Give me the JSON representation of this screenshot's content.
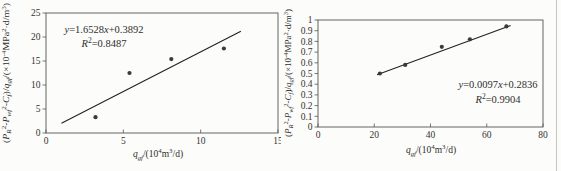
{
  "page": {
    "background": "#fcfcfa",
    "text_color": "#333333",
    "axis_color": "#555552",
    "line_color": "#222222",
    "marker_color": "#3a3a3a",
    "scan_edge_color": "#c4c4c0"
  },
  "chart_data": [
    {
      "type": "scatter",
      "title": "",
      "xlabel": "qgf/(10⁴m³/d)",
      "ylabel": "(PR²-Pwf²-Cf)/qgf/(×10⁻⁴MPa²·d/m³)",
      "equation": "y=1.6528x+0.3892",
      "r_squared": "R²=0.8487",
      "xlim": [
        0,
        15
      ],
      "ylim": [
        0,
        25
      ],
      "grid": false,
      "legend": "none",
      "xticks": [
        {
          "v": 0,
          "l": "0"
        },
        {
          "v": 5,
          "l": "5"
        },
        {
          "v": 10,
          "l": "10"
        },
        {
          "v": 15,
          "l": "15"
        }
      ],
      "yticks": [
        {
          "v": 0,
          "l": "0"
        },
        {
          "v": 5,
          "l": "5"
        },
        {
          "v": 10,
          "l": "10"
        },
        {
          "v": 15,
          "l": "15"
        },
        {
          "v": 20,
          "l": "20"
        },
        {
          "v": 25,
          "l": "25"
        }
      ],
      "points": [
        [
          3.2,
          3.3
        ],
        [
          5.4,
          12.5
        ],
        [
          8.1,
          15.4
        ],
        [
          11.5,
          17.6
        ]
      ],
      "trendline": {
        "slope": 1.6528,
        "intercept": 0.3892,
        "x_start": 1.0,
        "x_end": 12.6
      },
      "equation_parts": [
        {
          "t": "y",
          "s": "i"
        },
        {
          "t": "=1.6528",
          "s": "n"
        },
        {
          "t": "x",
          "s": "i"
        },
        {
          "t": "+0.3892",
          "s": "n"
        }
      ],
      "r2_parts": [
        {
          "t": "R",
          "s": "i"
        },
        {
          "t": "2",
          "s": "sup"
        },
        {
          "t": "=0.8487",
          "s": "n"
        }
      ],
      "xlabel_parts": [
        {
          "t": "q",
          "s": "i"
        },
        {
          "t": "gf",
          "s": "sub"
        },
        {
          "t": "/(10",
          "s": "n"
        },
        {
          "t": "4",
          "s": "sup"
        },
        {
          "t": "m",
          "s": "n"
        },
        {
          "t": "3",
          "s": "sup"
        },
        {
          "t": "/d)",
          "s": "n"
        }
      ],
      "ylabel_parts": [
        {
          "t": "(",
          "s": "n"
        },
        {
          "t": "P",
          "s": "i"
        },
        {
          "t": "R",
          "s": "sub"
        },
        {
          "t": "2",
          "s": "sup"
        },
        {
          "t": "-",
          "s": "n"
        },
        {
          "t": "P",
          "s": "i"
        },
        {
          "t": "wf",
          "s": "sub"
        },
        {
          "t": "2",
          "s": "sup"
        },
        {
          "t": "-",
          "s": "n"
        },
        {
          "t": "C",
          "s": "i"
        },
        {
          "t": "f",
          "s": "sub"
        },
        {
          "t": ")/",
          "s": "n"
        },
        {
          "t": "q",
          "s": "i"
        },
        {
          "t": "gf",
          "s": "sub"
        },
        {
          "t": "/(×10",
          "s": "n"
        },
        {
          "t": "-4",
          "s": "sup"
        },
        {
          "t": "MPa",
          "s": "n"
        },
        {
          "t": "2",
          "s": "sup"
        },
        {
          "t": "·d/m",
          "s": "n"
        },
        {
          "t": "3",
          "s": "sup"
        },
        {
          "t": ")",
          "s": "n"
        }
      ],
      "layout": {
        "svg_width": 281,
        "box": {
          "left": 46,
          "top": 13,
          "right": 278,
          "bottom": 133
        },
        "annotation": {
          "x": 104,
          "y": 33,
          "gap": 14,
          "font": 10.5
        },
        "xlabel": {
          "x": 158,
          "y": 157,
          "font": 9.5
        },
        "ylabel": {
          "x": 9,
          "y": 73,
          "font": 8,
          "length": 140
        }
      }
    },
    {
      "type": "scatter",
      "title": "",
      "xlabel": "qgf/(10⁴m³/d)",
      "ylabel": "(PR²-Pwf²-Cf)/qgf/(×10⁻⁴MPa²·d/m³)",
      "equation": "y=0.0097x+0.2836",
      "r_squared": "R²=0.9904",
      "xlim": [
        0,
        80
      ],
      "ylim": [
        0,
        1
      ],
      "grid": false,
      "legend": "none",
      "xticks": [
        {
          "v": 0,
          "l": "0"
        },
        {
          "v": 20,
          "l": "20"
        },
        {
          "v": 40,
          "l": "40"
        },
        {
          "v": 60,
          "l": "60"
        },
        {
          "v": 80,
          "l": "80"
        }
      ],
      "yticks": [
        {
          "v": 0,
          "l": "0"
        },
        {
          "v": 0.1,
          "l": "0.1"
        },
        {
          "v": 0.2,
          "l": "0.2"
        },
        {
          "v": 0.3,
          "l": "0.3"
        },
        {
          "v": 0.4,
          "l": "0.4"
        },
        {
          "v": 0.5,
          "l": "0.5"
        },
        {
          "v": 0.6,
          "l": "0.6"
        },
        {
          "v": 0.7,
          "l": "0.7"
        },
        {
          "v": 0.8,
          "l": "0.8"
        },
        {
          "v": 0.9,
          "l": "0.9"
        },
        {
          "v": 1,
          "l": "1"
        }
      ],
      "points": [
        [
          22,
          0.5
        ],
        [
          31,
          0.58
        ],
        [
          44,
          0.75
        ],
        [
          54,
          0.82
        ],
        [
          67,
          0.94
        ]
      ],
      "trendline": {
        "slope": 0.0097,
        "intercept": 0.2836,
        "x_start": 21.0,
        "x_end": 68.5
      },
      "equation_parts": [
        {
          "t": "y",
          "s": "i"
        },
        {
          "t": "=0.0097",
          "s": "n"
        },
        {
          "t": "x",
          "s": "i"
        },
        {
          "t": "+0.2836",
          "s": "n"
        }
      ],
      "r2_parts": [
        {
          "t": "R",
          "s": "i"
        },
        {
          "t": "2",
          "s": "sup"
        },
        {
          "t": "=0.9904",
          "s": "n"
        }
      ],
      "xlabel_parts": [
        {
          "t": "q",
          "s": "i"
        },
        {
          "t": "gf",
          "s": "sub"
        },
        {
          "t": "/(10",
          "s": "n"
        },
        {
          "t": "4",
          "s": "sup"
        },
        {
          "t": "m",
          "s": "n"
        },
        {
          "t": "3",
          "s": "sup"
        },
        {
          "t": "/d)",
          "s": "n"
        }
      ],
      "ylabel_parts": [
        {
          "t": "(",
          "s": "n"
        },
        {
          "t": "P",
          "s": "i"
        },
        {
          "t": "R",
          "s": "sub"
        },
        {
          "t": "2",
          "s": "sup"
        },
        {
          "t": "-",
          "s": "n"
        },
        {
          "t": "P",
          "s": "i"
        },
        {
          "t": "wf",
          "s": "sub"
        },
        {
          "t": "2",
          "s": "sup"
        },
        {
          "t": "-",
          "s": "n"
        },
        {
          "t": "C",
          "s": "i"
        },
        {
          "t": "f",
          "s": "sub"
        },
        {
          "t": ")/",
          "s": "n"
        },
        {
          "t": "q",
          "s": "i"
        },
        {
          "t": "gf",
          "s": "sub"
        },
        {
          "t": "/(×10",
          "s": "n"
        },
        {
          "t": "-4",
          "s": "sup"
        },
        {
          "t": "MPa",
          "s": "n"
        },
        {
          "t": "2",
          "s": "sup"
        },
        {
          "t": "·d/m",
          "s": "n"
        },
        {
          "t": "3",
          "s": "sup"
        },
        {
          "t": ")",
          "s": "n"
        }
      ],
      "layout": {
        "svg_width": 280,
        "box": {
          "left": 37,
          "top": 20,
          "right": 262,
          "bottom": 127
        },
        "annotation": {
          "x": 217,
          "y": 88,
          "gap": 15,
          "font": 10.5
        },
        "xlabel": {
          "x": 150,
          "y": 153,
          "font": 9.5
        },
        "ylabel": {
          "x": 10,
          "y": 73,
          "font": 8,
          "length": 128
        }
      }
    }
  ]
}
